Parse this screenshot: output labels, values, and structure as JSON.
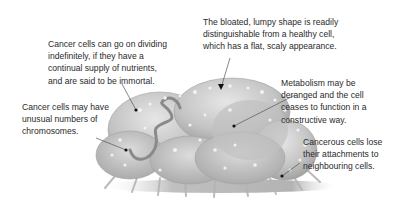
{
  "diagram": {
    "subject": "Cancer cell",
    "colors": {
      "cell_fill": "#c9c9c9",
      "cell_shadow": "#9a9a9a",
      "text": "#2a2a2a",
      "leader": "#555555"
    },
    "annotations": [
      {
        "id": "immortal",
        "lines": [
          "Cancer cells can go on dividing",
          "indefinitely, if they have a",
          "continual supply of nutrients,",
          "and are said to be immortal."
        ]
      },
      {
        "id": "shape",
        "lines": [
          "The bloated, lumpy shape is readily",
          "distinguishable from a healthy cell,",
          "which has a flat, scaly appearance."
        ]
      },
      {
        "id": "chromosomes",
        "lines": [
          "Cancer cells may have",
          "unusual numbers of",
          "chromosomes."
        ]
      },
      {
        "id": "metabolism",
        "lines": [
          "Metabolism may be",
          "deranged and the cell",
          "ceases to function in a",
          "constructive way."
        ]
      },
      {
        "id": "attachments",
        "lines": [
          "Cancerous cells lose",
          "their attachments to",
          "neighbouring cells."
        ]
      }
    ]
  }
}
